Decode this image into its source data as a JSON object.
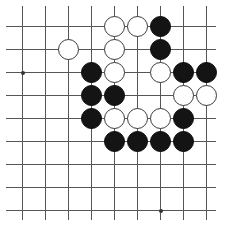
{
  "figure": {
    "name": "go-board-diagram",
    "type": "go-goban",
    "board_pixel_width": 227,
    "board_pixel_height": 234
  },
  "board": {
    "origin_x": 22,
    "origin_y": 26,
    "spacing": 23,
    "columns": 9,
    "rows": 9,
    "extra_left_line_x": -1,
    "line_color": "#555555",
    "background_color": "#ffffff",
    "black_color": "#141414",
    "white_color": "#ffffff",
    "stone_diameter": 21,
    "hoshi_color": "#333333",
    "hoshi_points": [
      {
        "col": 0,
        "row": 2
      },
      {
        "col": 6,
        "row": 8
      }
    ]
  },
  "stones": [
    {
      "color": "white",
      "col": 4,
      "row": 0,
      "label": "white-stone-e9"
    },
    {
      "color": "white",
      "col": 5,
      "row": 0,
      "label": "white-stone-f9"
    },
    {
      "color": "black",
      "col": 6,
      "row": 0,
      "label": "black-stone-g9"
    },
    {
      "color": "white",
      "col": 2,
      "row": 1,
      "label": "white-stone-c8"
    },
    {
      "color": "white",
      "col": 4,
      "row": 1,
      "label": "white-stone-e8"
    },
    {
      "color": "black",
      "col": 6,
      "row": 1,
      "label": "black-stone-g8"
    },
    {
      "color": "black",
      "col": 3,
      "row": 2,
      "label": "black-stone-d7"
    },
    {
      "color": "white",
      "col": 4,
      "row": 2,
      "label": "white-stone-e7"
    },
    {
      "color": "white",
      "col": 6,
      "row": 2,
      "label": "white-stone-g7"
    },
    {
      "color": "black",
      "col": 7,
      "row": 2,
      "label": "black-stone-h7"
    },
    {
      "color": "black",
      "col": 8,
      "row": 2,
      "label": "black-stone-j7"
    },
    {
      "color": "black",
      "col": 3,
      "row": 3,
      "label": "black-stone-d6"
    },
    {
      "color": "black",
      "col": 4,
      "row": 3,
      "label": "black-stone-e6"
    },
    {
      "color": "white",
      "col": 7,
      "row": 3,
      "label": "white-stone-h6"
    },
    {
      "color": "white",
      "col": 8,
      "row": 3,
      "label": "white-stone-j6"
    },
    {
      "color": "black",
      "col": 3,
      "row": 4,
      "label": "black-stone-d5"
    },
    {
      "color": "white",
      "col": 4,
      "row": 4,
      "label": "white-stone-e5"
    },
    {
      "color": "white",
      "col": 5,
      "row": 4,
      "label": "white-stone-f5"
    },
    {
      "color": "white",
      "col": 6,
      "row": 4,
      "label": "white-stone-g5"
    },
    {
      "color": "black",
      "col": 7,
      "row": 4,
      "label": "black-stone-h5"
    },
    {
      "color": "black",
      "col": 4,
      "row": 5,
      "label": "black-stone-e4"
    },
    {
      "color": "black",
      "col": 5,
      "row": 5,
      "label": "black-stone-f4"
    },
    {
      "color": "black",
      "col": 6,
      "row": 5,
      "label": "black-stone-g4"
    },
    {
      "color": "black",
      "col": 7,
      "row": 5,
      "label": "black-stone-h4"
    }
  ],
  "chart_data": {
    "type": "table",
    "xlabel": "board column",
    "ylabel": "board row",
    "legend": [
      "black stone",
      "white stone",
      "empty intersection"
    ],
    "grid": true,
    "columns": 9,
    "rows": 9,
    "black_count": 12,
    "white_count": 12
  }
}
